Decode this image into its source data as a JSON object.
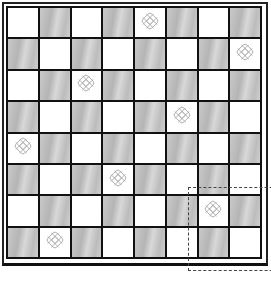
{
  "board": {
    "rows": 8,
    "cols": 8,
    "light_color": "#ffffff",
    "dark_color": "#c4c4c4",
    "line_color": "#111111",
    "pieces": [
      {
        "row": 0,
        "col": 4,
        "icon": "celtic-knot-icon"
      },
      {
        "row": 1,
        "col": 7,
        "icon": "celtic-knot-icon"
      },
      {
        "row": 2,
        "col": 2,
        "icon": "celtic-knot-icon"
      },
      {
        "row": 3,
        "col": 5,
        "icon": "celtic-knot-icon"
      },
      {
        "row": 4,
        "col": 0,
        "icon": "celtic-knot-icon"
      },
      {
        "row": 5,
        "col": 3,
        "icon": "celtic-knot-icon"
      },
      {
        "row": 6,
        "col": 6,
        "icon": "celtic-knot-icon"
      },
      {
        "row": 7,
        "col": 1,
        "icon": "celtic-knot-icon"
      }
    ]
  },
  "selection": {
    "style": "dashed",
    "from_row": 6,
    "from_col": 6
  }
}
